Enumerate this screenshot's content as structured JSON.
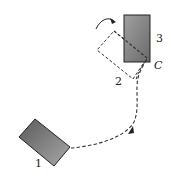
{
  "diagram": {
    "type": "rigid body motion (translation + rotation)",
    "labels": {
      "position_1": "1",
      "position_2": "2",
      "position_3": "3",
      "point_c": "C"
    },
    "colors": {
      "block_fill_light": "#a8a8a8",
      "block_fill_dark": "#555555",
      "outline": "#222222",
      "dashed": "#333333",
      "background": "#ffffff"
    }
  }
}
